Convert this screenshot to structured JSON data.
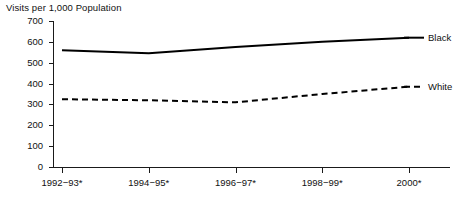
{
  "chart_data": {
    "type": "line",
    "title": "Visits per 1,000 Population",
    "xlabel": "",
    "ylabel": "",
    "ylim": [
      0,
      700
    ],
    "yticks": [
      0,
      100,
      200,
      300,
      400,
      500,
      600,
      700
    ],
    "ytick_labels": [
      "0",
      "100",
      "200",
      "300",
      "400",
      "500",
      "600",
      "700"
    ],
    "categories": [
      "1992−93*",
      "1994−95*",
      "1996−97*",
      "1998−99*",
      "2000*"
    ],
    "x": [
      1,
      2,
      3,
      4,
      5
    ],
    "grid": false,
    "legend_position": "right",
    "series": [
      {
        "name": "Black",
        "style": "solid",
        "color": "#000000",
        "values": [
          560,
          545,
          575,
          600,
          620
        ]
      },
      {
        "name": "White",
        "style": "dashed",
        "color": "#000000",
        "values": [
          325,
          320,
          310,
          350,
          385
        ]
      }
    ]
  },
  "legend": {
    "entries": [
      {
        "label": "Black",
        "style": "solid"
      },
      {
        "label": "White",
        "style": "dashed"
      }
    ]
  }
}
